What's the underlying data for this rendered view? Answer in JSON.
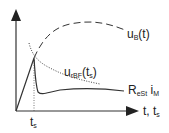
{
  "diagram": {
    "type": "voltage-current-time sketch",
    "axes": {
      "x_label_main": "t, t",
      "x_label_sub": "s",
      "x_tick_main": "t",
      "x_tick_sub": "s"
    },
    "curves": [
      {
        "id": "uB",
        "style": "dashed",
        "label_main": "u",
        "label_sub": "B",
        "label_suffix": "(t)"
      },
      {
        "id": "urBF",
        "style": "dotted",
        "label_main": "u",
        "label_sub": "rBF",
        "label_suffix": "(t",
        "label_sub2": "s",
        "label_end": ")"
      },
      {
        "id": "ReSt_iM",
        "style": "solid",
        "label_main": "R",
        "label_sub": "eSt",
        "label_mid": " i",
        "label_sub2": "M"
      }
    ]
  }
}
